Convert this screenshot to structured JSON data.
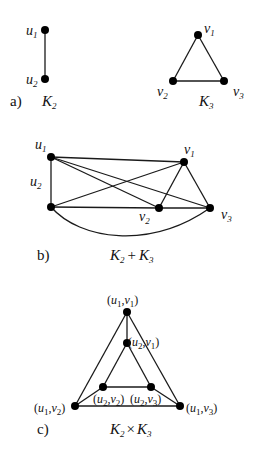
{
  "figure": {
    "panel_a": {
      "caption_letter": "a)",
      "k2": {
        "title": "K",
        "title_sub": "2",
        "nodes": [
          {
            "id": "u1",
            "base": "u",
            "sub": "1",
            "x": 45,
            "y": 30
          },
          {
            "id": "u2",
            "base": "u",
            "sub": "2",
            "x": 45,
            "y": 79
          }
        ],
        "edges": [
          [
            "u1",
            "u2"
          ]
        ]
      },
      "k3": {
        "title": "K",
        "title_sub": "3",
        "nodes": [
          {
            "id": "v1",
            "base": "v",
            "sub": "1",
            "x": 198,
            "y": 35
          },
          {
            "id": "v2",
            "base": "v",
            "sub": "2",
            "x": 173,
            "y": 81
          },
          {
            "id": "v3",
            "base": "v",
            "sub": "3",
            "x": 224,
            "y": 81
          }
        ],
        "edges": [
          [
            "v1",
            "v2"
          ],
          [
            "v1",
            "v3"
          ],
          [
            "v2",
            "v3"
          ]
        ]
      }
    },
    "panel_b": {
      "caption_letter": "b)",
      "title": "K₂ + K₃",
      "title_parts": {
        "k": "K",
        "s1": "2",
        "plus": "+",
        "s2": "3"
      },
      "nodes": [
        {
          "id": "u1",
          "base": "u",
          "sub": "1",
          "x": 51,
          "y": 157
        },
        {
          "id": "u2",
          "base": "u",
          "sub": "2",
          "x": 51,
          "y": 207
        },
        {
          "id": "v1",
          "base": "v",
          "sub": "1",
          "x": 184,
          "y": 162
        },
        {
          "id": "v2",
          "base": "v",
          "sub": "2",
          "x": 159,
          "y": 208
        },
        {
          "id": "v3",
          "base": "v",
          "sub": "3",
          "x": 210,
          "y": 208
        }
      ],
      "edges": [
        [
          "u1",
          "u2"
        ],
        [
          "u1",
          "v1"
        ],
        [
          "u1",
          "v2"
        ],
        [
          "u1",
          "v3"
        ],
        [
          "u2",
          "v1"
        ],
        [
          "u2",
          "v2"
        ],
        [
          "u2",
          "v3"
        ],
        [
          "v1",
          "v2"
        ],
        [
          "v1",
          "v3"
        ],
        [
          "v2",
          "v3"
        ]
      ]
    },
    "panel_c": {
      "caption_letter": "c)",
      "title": "K₂ × K₃",
      "title_parts": {
        "k": "K",
        "s1": "2",
        "times": "×",
        "s2": "3"
      },
      "nodes": [
        {
          "id": "u1v1",
          "label": "(u1,v1)",
          "x": 127,
          "y": 312
        },
        {
          "id": "u2v1",
          "label": "(u2,v1)",
          "x": 127,
          "y": 343
        },
        {
          "id": "u2v2",
          "label": "(u2,v2)",
          "x": 103,
          "y": 387
        },
        {
          "id": "u2v3",
          "label": "(u2,v3)",
          "x": 151,
          "y": 387
        },
        {
          "id": "u1v2",
          "label": "(u1,v2)",
          "x": 75,
          "y": 406
        },
        {
          "id": "u1v3",
          "label": "(u1,v3)",
          "x": 180,
          "y": 406
        }
      ],
      "edges": [
        [
          "u1v1",
          "u1v2"
        ],
        [
          "u1v1",
          "u1v3"
        ],
        [
          "u1v2",
          "u1v3"
        ],
        [
          "u2v1",
          "u2v2"
        ],
        [
          "u2v1",
          "u2v3"
        ],
        [
          "u2v2",
          "u2v3"
        ],
        [
          "u1v1",
          "u2v1"
        ],
        [
          "u1v2",
          "u2v2"
        ],
        [
          "u1v3",
          "u2v3"
        ]
      ]
    }
  }
}
